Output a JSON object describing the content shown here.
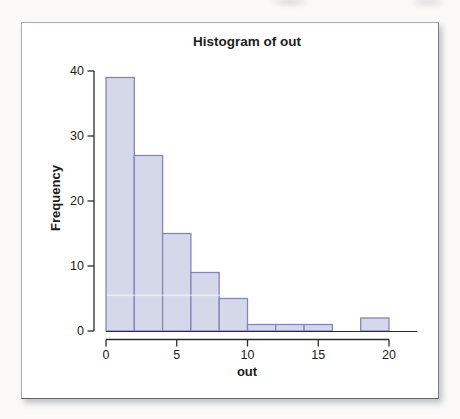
{
  "figure": {
    "title": "Histogram of out",
    "xlabel": "out",
    "ylabel": "Frequency"
  },
  "chart_data": {
    "type": "bar",
    "subtype": "histogram",
    "title": "Histogram of out",
    "xlabel": "out",
    "ylabel": "Frequency",
    "bin_edges": [
      0,
      2,
      4,
      6,
      8,
      10,
      12,
      14,
      16,
      18,
      20
    ],
    "counts": [
      39,
      27,
      15,
      9,
      5,
      1,
      1,
      1,
      0,
      2
    ],
    "x_ticks": [
      0,
      5,
      10,
      15,
      20
    ],
    "y_ticks": [
      0,
      10,
      20,
      30,
      40
    ],
    "xlim": [
      0,
      22
    ],
    "ylim": [
      0,
      40
    ],
    "grid": false,
    "legend_position": "none",
    "colors": {
      "bar_fill": "#d5d8e9",
      "bar_stroke": "#8387b9",
      "axis": "#2b2b2b",
      "text": "#1c1c1c",
      "frame_border": "#a6abce"
    }
  }
}
